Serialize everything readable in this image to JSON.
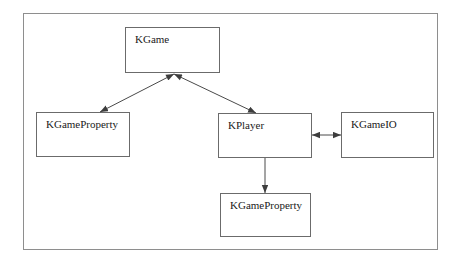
{
  "figure": {
    "type": "class-diagram",
    "background_color": "#ffffff",
    "frame": {
      "border_color": "#8e8e8e",
      "x": 23,
      "y": 13,
      "width": 415,
      "height": 237
    },
    "box_style": {
      "fill": "#ffffff",
      "border_color": "#6b6b6b",
      "text_color": "#1a1a1a"
    },
    "connector_color": "#4a4a4a"
  },
  "nodes": [
    {
      "id": "kgame",
      "label": "KGame",
      "x": 125,
      "y": 27,
      "width": 95,
      "height": 46
    },
    {
      "id": "kgameproperty_left",
      "label": "KGameProperty",
      "x": 36,
      "y": 112,
      "width": 94,
      "height": 45
    },
    {
      "id": "kplayer",
      "label": "KPlayer",
      "x": 218,
      "y": 113,
      "width": 94,
      "height": 45
    },
    {
      "id": "kgameio",
      "label": "KGameIO",
      "x": 341,
      "y": 112,
      "width": 93,
      "height": 46
    },
    {
      "id": "kgameproperty_bottom",
      "label": "KGameProperty",
      "x": 220,
      "y": 193,
      "width": 91,
      "height": 44
    }
  ],
  "edges": [
    {
      "id": "edge-kgame-kgameproperty",
      "from": "kgame",
      "to": "kgameproperty_left",
      "kind": "double-headed",
      "x1": 174,
      "y1": 74,
      "x2": 100,
      "y2": 112
    },
    {
      "id": "edge-kgame-kplayer",
      "from": "kgame",
      "to": "kplayer",
      "kind": "double-headed",
      "x1": 174,
      "y1": 74,
      "x2": 256,
      "y2": 113
    },
    {
      "id": "edge-kplayer-kgameio",
      "from": "kplayer",
      "to": "kgameio",
      "kind": "double-headed",
      "x1": 312,
      "y1": 135,
      "x2": 341,
      "y2": 135
    },
    {
      "id": "edge-kplayer-kgameproperty",
      "from": "kplayer",
      "to": "kgameproperty_bottom",
      "kind": "single-headed",
      "x1": 265,
      "y1": 158,
      "x2": 265,
      "y2": 193
    }
  ]
}
